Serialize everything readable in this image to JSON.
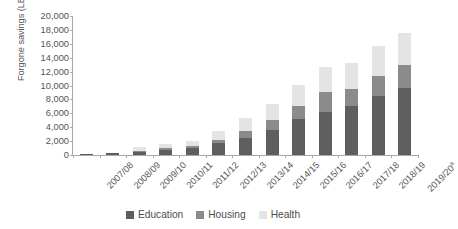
{
  "chart_data": {
    "type": "bar",
    "subtype": "stacked-vertical",
    "title": "",
    "xlabel": "",
    "ylabel": "Forgone savings (LE, millions)",
    "ylim": [
      0,
      20000
    ],
    "ytick_step": 2000,
    "ytick_labels": [
      "0",
      "2,000",
      "4,000",
      "6,000",
      "8,000",
      "10,000",
      "12,000",
      "14,000",
      "16,000",
      "18,000",
      "20,000"
    ],
    "ytick_values": [
      0,
      2000,
      4000,
      6000,
      8000,
      10000,
      12000,
      14000,
      16000,
      18000,
      20000
    ],
    "grid": false,
    "legend_position": "bottom",
    "categories": [
      "2007/08",
      "2008/09",
      "2009/10",
      "2010/11",
      "2011/12",
      "2012/13",
      "2013/14",
      "2014/15",
      "2015/16",
      "2016/17",
      "2017/18",
      "2018/19",
      "2019/20"
    ],
    "category_notes": {
      "2019/20": "a"
    },
    "series": [
      {
        "name": "Education",
        "color": "#5e5e5e",
        "values": [
          100,
          250,
          450,
          750,
          1050,
          1700,
          2500,
          3650,
          5200,
          6250,
          7000,
          8550,
          9600
        ]
      },
      {
        "name": "Housing",
        "color": "#8b8b8b",
        "values": [
          40,
          60,
          160,
          230,
          300,
          400,
          1000,
          1350,
          1800,
          2800,
          2500,
          2850,
          3400
        ]
      },
      {
        "name": "Health",
        "color": "#e4e4e4",
        "values": [
          30,
          50,
          600,
          550,
          700,
          1300,
          1800,
          2400,
          3100,
          3550,
          3700,
          4300,
          4500
        ]
      }
    ],
    "totals": [
      170,
      360,
      1210,
      1530,
      2050,
      3400,
      5300,
      7400,
      10100,
      12600,
      13200,
      15700,
      17500
    ]
  },
  "legend": {
    "items": [
      {
        "label": "Education",
        "swatch_name": "legend-swatch-education"
      },
      {
        "label": "Housing",
        "swatch_name": "legend-swatch-housing"
      },
      {
        "label": "Health",
        "swatch_name": "legend-swatch-health"
      }
    ]
  }
}
